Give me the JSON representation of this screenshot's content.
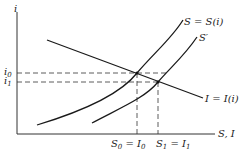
{
  "diagram": {
    "type": "savings-investment",
    "axes": {
      "y_label": "i",
      "x_label": "S, I"
    },
    "curves": {
      "savings": {
        "label": "S = S(i)"
      },
      "savings_shifted": {
        "label": "S′"
      },
      "investment": {
        "label": "I = I(i)"
      }
    },
    "y_ticks": [
      {
        "label": "i",
        "sub": "0"
      },
      {
        "label": "i",
        "sub": "1"
      }
    ],
    "x_ticks": [
      {
        "label": "S",
        "sub": "0",
        "eq": " = I",
        "sub2": "0"
      },
      {
        "label": "S",
        "sub": "1",
        "eq": " = I",
        "sub2": "1"
      }
    ]
  }
}
